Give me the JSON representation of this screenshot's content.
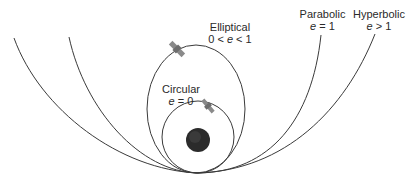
{
  "labels": {
    "circular": {
      "name": "Circular",
      "eq_var": "e",
      "eq_rest": " = 0"
    },
    "elliptical": {
      "name": "Elliptical",
      "eq_pre": "0 < ",
      "eq_var": "e",
      "eq_rest": " < 1"
    },
    "parabolic": {
      "name": "Parabolic",
      "eq_var": "e",
      "eq_rest": " = 1"
    },
    "hyperbolic": {
      "name": "Hyperbolic",
      "eq_var": "e",
      "eq_rest": " > 1"
    }
  },
  "colors": {
    "line": "#3a3a3a",
    "planet": "#2b2b2b",
    "satellite": "#8a8a8a"
  },
  "icons": [
    "planet-icon",
    "satellite-icon"
  ]
}
